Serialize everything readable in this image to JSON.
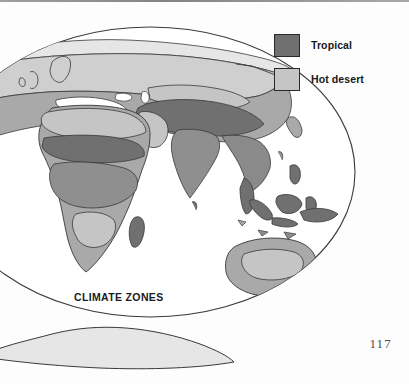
{
  "page": {
    "folio": "117",
    "background_color": "#fdfdfd"
  },
  "figure": {
    "title": "CLIMATE ZONES",
    "projection": "oval world map",
    "outline_color": "#3a3a3a"
  },
  "legend": {
    "items": [
      {
        "label": "Tropical",
        "color": "#707070",
        "swatch_name": "legend-swatch-tropical"
      },
      {
        "label": "Hot desert",
        "color": "#c5c5c5",
        "swatch_name": "legend-swatch-hot-desert"
      }
    ]
  },
  "palette": {
    "tropical": "#707070",
    "hot_desert": "#c5c5c5",
    "temperate": "#a9a9a9",
    "cool": "#cfcfcf",
    "polar": "#e6e6e6",
    "land_outline": "#39393b",
    "ocean": "#ffffff"
  },
  "map_regions": [
    {
      "name": "Eurasia",
      "zones": [
        "polar",
        "cool",
        "temperate",
        "hot_desert",
        "tropical"
      ]
    },
    {
      "name": "Africa",
      "zones": [
        "temperate",
        "hot_desert",
        "tropical"
      ]
    },
    {
      "name": "India",
      "zones": [
        "tropical",
        "hot_desert"
      ]
    },
    {
      "name": "Southeast Asia",
      "zones": [
        "tropical"
      ]
    },
    {
      "name": "Indonesia",
      "zones": [
        "tropical"
      ]
    },
    {
      "name": "Australia",
      "zones": [
        "hot_desert",
        "temperate"
      ]
    },
    {
      "name": "Antarctica",
      "zones": [
        "polar"
      ]
    }
  ]
}
